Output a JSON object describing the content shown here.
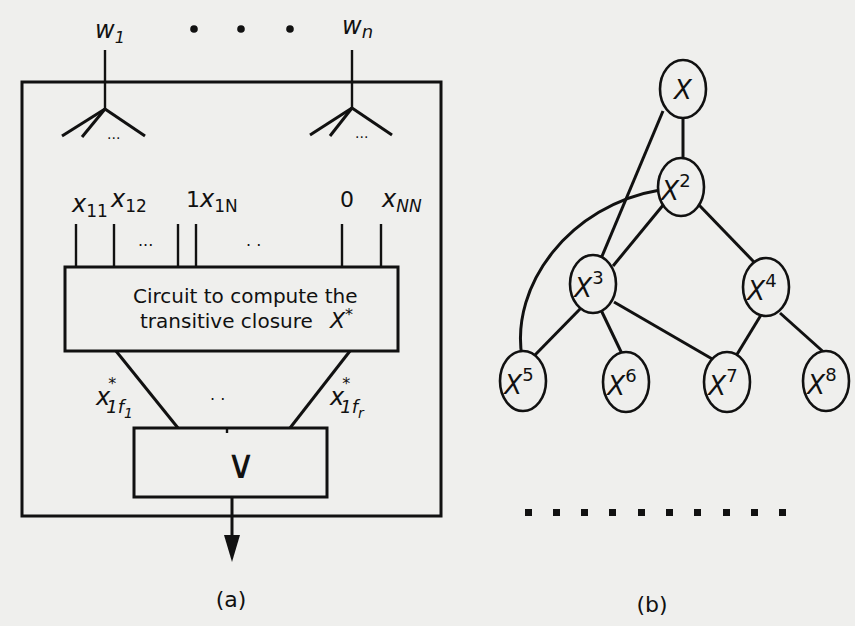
{
  "figure_a": {
    "caption": "(a)",
    "top_inputs": [
      {
        "var": "w",
        "sub": "1"
      },
      {
        "var": "w",
        "sub": "n"
      }
    ],
    "top_ellipsis": "• • •",
    "fan_ellipsis": "...",
    "matrix_inputs": [
      {
        "prefix": "",
        "var": "x",
        "sub": "11"
      },
      {
        "prefix": "",
        "var": "x",
        "sub": "12"
      },
      {
        "prefix": "1",
        "var": "x",
        "sub": "1N"
      },
      {
        "prefix": "0",
        "var": "",
        "sub": ""
      },
      {
        "prefix": "",
        "var": "x",
        "sub": "NN"
      }
    ],
    "matrix_ellipsis_1": "...",
    "matrix_ellipsis_2": ". .",
    "circuit_box": {
      "line1": "Circuit to compute the",
      "line2": "transitive closure",
      "symbol": "X",
      "symbol_sup": "*"
    },
    "outputs": [
      {
        "var": "x",
        "sup": "*",
        "sub": "1f",
        "subsub": "1"
      },
      {
        "var": "x",
        "sup": "*",
        "sub": "1f",
        "subsub": "r"
      }
    ],
    "outputs_ellipsis": ". .",
    "or_gate": {
      "symbol": "∨"
    }
  },
  "figure_b": {
    "caption": "(b)",
    "nodes": [
      {
        "id": "n1",
        "label": "X",
        "exp": ""
      },
      {
        "id": "n2",
        "label": "X",
        "exp": "2"
      },
      {
        "id": "n3",
        "label": "X",
        "exp": "3"
      },
      {
        "id": "n4",
        "label": "X",
        "exp": "4"
      },
      {
        "id": "n5",
        "label": "X",
        "exp": "5"
      },
      {
        "id": "n6",
        "label": "X",
        "exp": "6"
      },
      {
        "id": "n7",
        "label": "X",
        "exp": "7"
      },
      {
        "id": "n8",
        "label": "X",
        "exp": "8"
      }
    ],
    "edges": [
      [
        "X",
        "X^2"
      ],
      [
        "X",
        "X^3"
      ],
      [
        "X^2",
        "X^3"
      ],
      [
        "X^2",
        "X^4"
      ],
      [
        "X^2",
        "X^5"
      ],
      [
        "X^3",
        "X^5"
      ],
      [
        "X^3",
        "X^6"
      ],
      [
        "X^3",
        "X^7"
      ],
      [
        "X^4",
        "X^7"
      ],
      [
        "X^4",
        "X^8"
      ]
    ],
    "continuation": "· · · · · · · · · ·"
  }
}
